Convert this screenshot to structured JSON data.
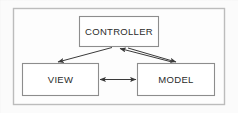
{
  "diagram": {
    "type": "block-diagram",
    "frame": {
      "name": "outer-frame",
      "x": 13,
      "y": 8,
      "width": 212,
      "height": 97,
      "stroke": "#b9b9b9",
      "fill": "#fdfdfd"
    },
    "background_color": "#fbfbfb",
    "box_stroke_color": "#8a8a8a",
    "box_fill_color": "#ffffff",
    "arrow_color": "#3a3a3a",
    "text_color": "#2b2b2b",
    "nodes": [
      {
        "id": "controller",
        "label": "CONTROLLER",
        "x": 79,
        "y": 16,
        "width": 80,
        "height": 31
      },
      {
        "id": "view",
        "label": "VIEW",
        "x": 22,
        "y": 63,
        "width": 77,
        "height": 33
      },
      {
        "id": "model",
        "label": "MODEL",
        "x": 137,
        "y": 63,
        "width": 78,
        "height": 33
      }
    ],
    "edges": [
      {
        "id": "controller-to-view",
        "from": "controller",
        "to": "view",
        "direction": "one-way",
        "arrowheads": "target"
      },
      {
        "id": "controller-to-model",
        "from": "controller",
        "to": "model",
        "direction": "one-way",
        "arrowheads": "target"
      },
      {
        "id": "view-to-controller",
        "from": "view",
        "to": "controller",
        "direction": "one-way",
        "arrowheads": "target"
      },
      {
        "id": "view-model-bidirectional",
        "from": "view",
        "to": "model",
        "direction": "two-way",
        "arrowheads": "both"
      }
    ]
  }
}
